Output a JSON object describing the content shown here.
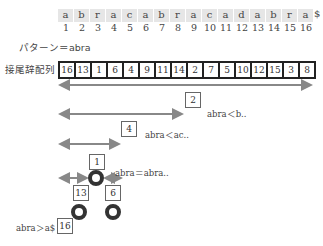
{
  "text": {
    "chars": [
      "a",
      "b",
      "r",
      "a",
      "c",
      "a",
      "b",
      "r",
      "a",
      "c",
      "a",
      "d",
      "a",
      "b",
      "r",
      "a"
    ],
    "terminator": "$",
    "indices": [
      "1",
      "2",
      "3",
      "4",
      "5",
      "6",
      "7",
      "8",
      "9",
      "10",
      "11",
      "12",
      "13",
      "14",
      "15",
      "16"
    ]
  },
  "labels": {
    "pattern": "パターン＝abra",
    "suffix_array": "接尾辞配列"
  },
  "suffix_array": [
    "16",
    "13",
    "1",
    "6",
    "4",
    "9",
    "11",
    "14",
    "2",
    "7",
    "5",
    "10",
    "12",
    "15",
    "3",
    "8"
  ],
  "search_steps": [
    {
      "probe": "2",
      "comparison": "abra＜b.."
    },
    {
      "probe": "4",
      "comparison": "abra＜ac.."
    },
    {
      "probe": "1",
      "comparison": "abra＝abra.."
    },
    {
      "probe": "13",
      "comparison": ""
    },
    {
      "probe": "6",
      "comparison": ""
    },
    {
      "probe": "16",
      "comparison": "abra＞a$"
    }
  ],
  "colors": {
    "arrow": "#888888",
    "ring": "#333333",
    "cell_bg": "#e6e6e6"
  }
}
